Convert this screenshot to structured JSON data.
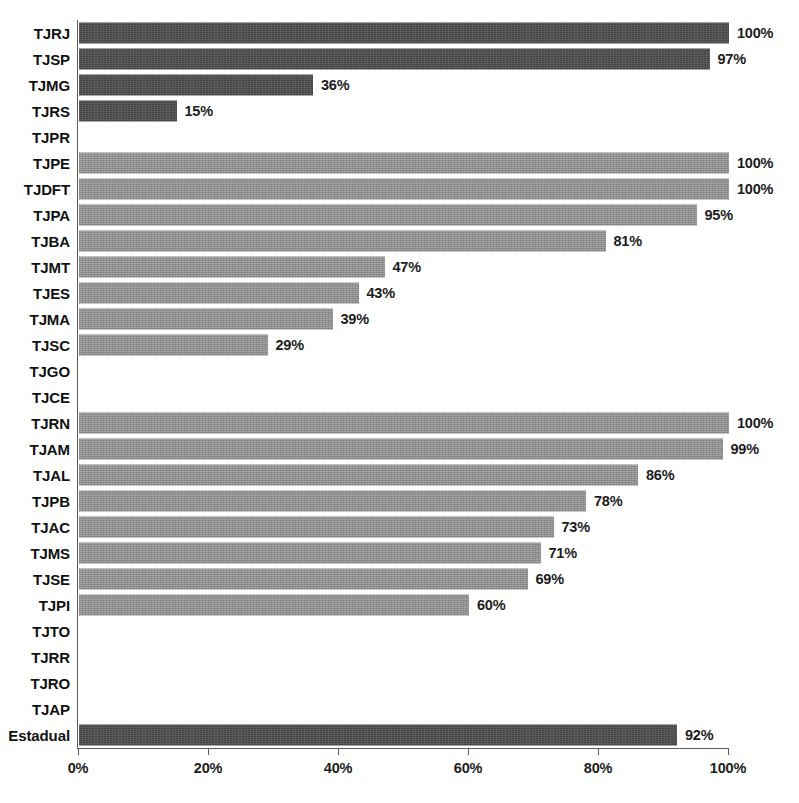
{
  "chart_data": {
    "type": "bar",
    "orientation": "horizontal",
    "title": "",
    "xlabel": "",
    "ylabel": "",
    "xlim": [
      0,
      100
    ],
    "xtick_labels": [
      "0%",
      "20%",
      "40%",
      "60%",
      "80%",
      "100%"
    ],
    "xticks": [
      0,
      20,
      40,
      60,
      80,
      100
    ],
    "grid": false,
    "legend": null,
    "value_suffix": "%",
    "colors": {
      "dark": "#464646",
      "mid": "#8c8c8c",
      "axis": "#5c5c5c",
      "text": "#1c1c1c",
      "background": "#ffffff"
    },
    "categories": [
      "TJRJ",
      "TJSP",
      "TJMG",
      "TJRS",
      "TJPR",
      "TJPE",
      "TJDFT",
      "TJPA",
      "TJBA",
      "TJMT",
      "TJES",
      "TJMA",
      "TJSC",
      "TJGO",
      "TJCE",
      "TJRN",
      "TJAM",
      "TJAL",
      "TJPB",
      "TJAC",
      "TJMS",
      "TJSE",
      "TJPI",
      "TJTO",
      "TJRR",
      "TJRO",
      "TJAP",
      "Estadual"
    ],
    "values": [
      100,
      97,
      36,
      15,
      0,
      100,
      100,
      95,
      81,
      47,
      43,
      39,
      29,
      0,
      0,
      100,
      99,
      86,
      78,
      73,
      71,
      69,
      60,
      0,
      0,
      0,
      0,
      92
    ],
    "rows": [
      {
        "label": "TJRJ",
        "value": 100,
        "value_label": "100%",
        "shade": "dark",
        "has_bar": true
      },
      {
        "label": "TJSP",
        "value": 97,
        "value_label": "97%",
        "shade": "dark",
        "has_bar": true
      },
      {
        "label": "TJMG",
        "value": 36,
        "value_label": "36%",
        "shade": "dark",
        "has_bar": true
      },
      {
        "label": "TJRS",
        "value": 15,
        "value_label": "15%",
        "shade": "dark",
        "has_bar": true
      },
      {
        "label": "TJPR",
        "value": 0,
        "value_label": "",
        "shade": "dark",
        "has_bar": false
      },
      {
        "label": "TJPE",
        "value": 100,
        "value_label": "100%",
        "shade": "mid",
        "has_bar": true
      },
      {
        "label": "TJDFT",
        "value": 100,
        "value_label": "100%",
        "shade": "mid",
        "has_bar": true
      },
      {
        "label": "TJPA",
        "value": 95,
        "value_label": "95%",
        "shade": "mid",
        "has_bar": true
      },
      {
        "label": "TJBA",
        "value": 81,
        "value_label": "81%",
        "shade": "mid",
        "has_bar": true
      },
      {
        "label": "TJMT",
        "value": 47,
        "value_label": "47%",
        "shade": "mid",
        "has_bar": true
      },
      {
        "label": "TJES",
        "value": 43,
        "value_label": "43%",
        "shade": "mid",
        "has_bar": true
      },
      {
        "label": "TJMA",
        "value": 39,
        "value_label": "39%",
        "shade": "mid",
        "has_bar": true
      },
      {
        "label": "TJSC",
        "value": 29,
        "value_label": "29%",
        "shade": "mid",
        "has_bar": true
      },
      {
        "label": "TJGO",
        "value": 0,
        "value_label": "",
        "shade": "mid",
        "has_bar": false
      },
      {
        "label": "TJCE",
        "value": 0,
        "value_label": "",
        "shade": "mid",
        "has_bar": false
      },
      {
        "label": "TJRN",
        "value": 100,
        "value_label": "100%",
        "shade": "mid",
        "has_bar": true
      },
      {
        "label": "TJAM",
        "value": 99,
        "value_label": "99%",
        "shade": "mid",
        "has_bar": true
      },
      {
        "label": "TJAL",
        "value": 86,
        "value_label": "86%",
        "shade": "mid",
        "has_bar": true
      },
      {
        "label": "TJPB",
        "value": 78,
        "value_label": "78%",
        "shade": "mid",
        "has_bar": true
      },
      {
        "label": "TJAC",
        "value": 73,
        "value_label": "73%",
        "shade": "mid",
        "has_bar": true
      },
      {
        "label": "TJMS",
        "value": 71,
        "value_label": "71%",
        "shade": "mid",
        "has_bar": true
      },
      {
        "label": "TJSE",
        "value": 69,
        "value_label": "69%",
        "shade": "mid",
        "has_bar": true
      },
      {
        "label": "TJPI",
        "value": 60,
        "value_label": "60%",
        "shade": "mid",
        "has_bar": true
      },
      {
        "label": "TJTO",
        "value": 0,
        "value_label": "",
        "shade": "mid",
        "has_bar": false
      },
      {
        "label": "TJRR",
        "value": 0,
        "value_label": "",
        "shade": "mid",
        "has_bar": false
      },
      {
        "label": "TJRO",
        "value": 0,
        "value_label": "",
        "shade": "mid",
        "has_bar": false
      },
      {
        "label": "TJAP",
        "value": 0,
        "value_label": "",
        "shade": "mid",
        "has_bar": false
      },
      {
        "label": "Estadual",
        "value": 92,
        "value_label": "92%",
        "shade": "dark",
        "has_bar": true
      }
    ]
  }
}
